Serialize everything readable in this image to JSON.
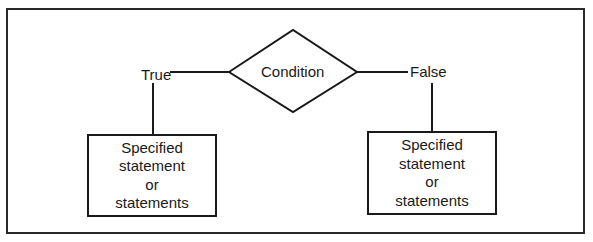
{
  "diagram": {
    "condition": {
      "label": "Condition"
    },
    "true_branch": {
      "label": "True",
      "box_lines": [
        "Specified",
        "statement",
        "or",
        "statements"
      ]
    },
    "false_branch": {
      "label": "False",
      "box_lines": [
        "Specified",
        "statement",
        "or",
        "statements"
      ]
    }
  }
}
